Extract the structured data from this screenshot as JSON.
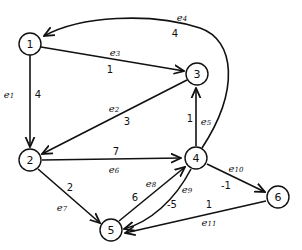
{
  "diagram": {
    "type": "directed-weighted-graph",
    "nodes": [
      {
        "id": "1",
        "label": "1",
        "x": 30,
        "y": 44
      },
      {
        "id": "2",
        "label": "2",
        "x": 30,
        "y": 160
      },
      {
        "id": "3",
        "label": "3",
        "x": 197,
        "y": 74
      },
      {
        "id": "4",
        "label": "4",
        "x": 196,
        "y": 158
      },
      {
        "id": "5",
        "label": "5",
        "x": 111,
        "y": 230
      },
      {
        "id": "6",
        "label": "6",
        "x": 278,
        "y": 197
      }
    ],
    "edges": [
      {
        "id": "e1",
        "name": "e",
        "sub": "1",
        "from": "1",
        "to": "2",
        "weight": "4"
      },
      {
        "id": "e2",
        "name": "e",
        "sub": "2",
        "from": "3",
        "to": "2",
        "weight": "3"
      },
      {
        "id": "e3",
        "name": "e",
        "sub": "3",
        "from": "1",
        "to": "3",
        "weight": "1"
      },
      {
        "id": "e4",
        "name": "e",
        "sub": "4",
        "from": "4",
        "to": "1",
        "weight": "4"
      },
      {
        "id": "e5",
        "name": "e",
        "sub": "5",
        "from": "4",
        "to": "3",
        "weight": "1"
      },
      {
        "id": "e6",
        "name": "e",
        "sub": "6",
        "from": "2",
        "to": "4",
        "weight": "7"
      },
      {
        "id": "e7",
        "name": "e",
        "sub": "7",
        "from": "2",
        "to": "5",
        "weight": "2"
      },
      {
        "id": "e8",
        "name": "e",
        "sub": "8",
        "from": "5",
        "to": "4",
        "weight": "6"
      },
      {
        "id": "e9",
        "name": "e",
        "sub": "9",
        "from": "4",
        "to": "5",
        "weight": "-5"
      },
      {
        "id": "e10",
        "name": "e",
        "sub": "10",
        "from": "4",
        "to": "6",
        "weight": "-1"
      },
      {
        "id": "e11",
        "name": "e",
        "sub": "11",
        "from": "6",
        "to": "5",
        "weight": "1"
      }
    ]
  }
}
